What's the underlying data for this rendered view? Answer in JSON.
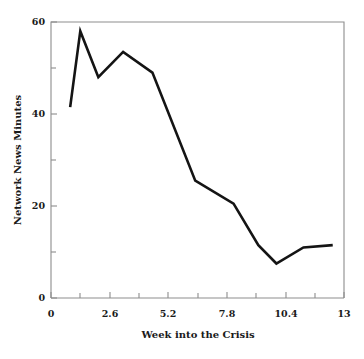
{
  "chart_data": {
    "type": "line",
    "title": "",
    "subtitle": "",
    "xlabel": "Week into the Crisis",
    "ylabel": "Network News Minutes",
    "xlim": [
      0,
      13
    ],
    "ylim": [
      0,
      60
    ],
    "grid": false,
    "legend": null,
    "legend_position": "none",
    "x_tick_labels": [
      "0",
      "2.6",
      "5.2",
      "7.8",
      "10.4",
      "13"
    ],
    "x_tick_values": [
      0,
      2.6,
      5.2,
      7.8,
      10.4,
      13
    ],
    "x_minor_tick_values": [
      1.3,
      3.9,
      6.5,
      9.1,
      11.7
    ],
    "y_tick_labels": [
      "0",
      "20",
      "40",
      "60"
    ],
    "y_tick_values": [
      0,
      20,
      40,
      60
    ],
    "y_minor_tick_values": [
      10,
      30,
      50
    ],
    "series": [
      {
        "name": "Network News Minutes",
        "color": "#141414",
        "x": [
          0.85,
          1.3,
          2.1,
          3.2,
          4.5,
          6.4,
          8.1,
          9.2,
          10.0,
          11.2,
          12.5
        ],
        "values": [
          41.5,
          58.0,
          48.0,
          53.5,
          49.0,
          25.5,
          20.5,
          11.5,
          7.5,
          11.0,
          11.5
        ]
      }
    ],
    "annotations": []
  },
  "axes": {
    "x_axis_name": "Week into the Crisis",
    "y_axis_name": "Network News Minutes"
  },
  "style": {
    "line_color": "#141414",
    "frame_color": "#8d8d8d",
    "text_color": "#1a1a1a",
    "background": "#ffffff"
  }
}
